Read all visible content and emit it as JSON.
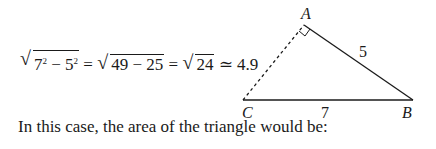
{
  "equation": {
    "term1_base": "7",
    "term1_exp": "2",
    "minus": " − ",
    "term2_base": "5",
    "term2_exp": "2",
    "eq1": " = ",
    "radicand2": "49 − 25",
    "eq2": " = ",
    "radicand3": "24",
    "approx": " ≃ 4.9"
  },
  "diagram": {
    "vertices": {
      "A": "A",
      "B": "B",
      "C": "C"
    },
    "side_AB": "5",
    "side_CB": "7",
    "side_AC_style": "dashed",
    "right_angle_at": "A"
  },
  "caption": "In this case, the area of the triangle would be:"
}
